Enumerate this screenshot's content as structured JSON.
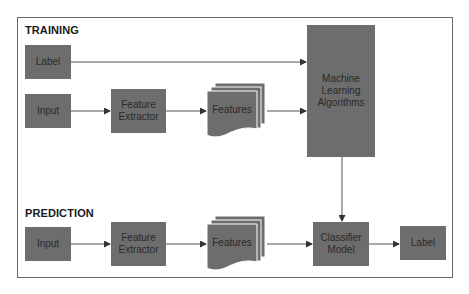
{
  "diagram": {
    "sections": {
      "training": {
        "title": "TRAINING"
      },
      "prediction": {
        "title": "PREDICTION"
      }
    },
    "training": {
      "label_node": "Label",
      "input_node": "Input",
      "feature_extractor": [
        "Feature",
        "Extractor"
      ],
      "features": "Features",
      "ml_algorithms": [
        "Machine",
        "Learning",
        "Algorithms"
      ]
    },
    "prediction": {
      "input_node": "Input",
      "feature_extractor": [
        "Feature",
        "Extractor"
      ],
      "features": "Features",
      "classifier": [
        "Classifier",
        "Model"
      ],
      "label_node": "Label"
    },
    "edges": [
      {
        "from": "training.label_node",
        "to": "training.ml_algorithms"
      },
      {
        "from": "training.input_node",
        "to": "training.feature_extractor"
      },
      {
        "from": "training.feature_extractor",
        "to": "training.features"
      },
      {
        "from": "training.features",
        "to": "training.ml_algorithms"
      },
      {
        "from": "training.ml_algorithms",
        "to": "prediction.classifier"
      },
      {
        "from": "prediction.input_node",
        "to": "prediction.feature_extractor"
      },
      {
        "from": "prediction.feature_extractor",
        "to": "prediction.features"
      },
      {
        "from": "prediction.features",
        "to": "prediction.classifier"
      },
      {
        "from": "prediction.classifier",
        "to": "prediction.label_node"
      }
    ],
    "colors": {
      "node_fill": "#6d6d6d",
      "node_text": "#2a2a2a",
      "edge": "#555555",
      "frame": "#6a6a6a"
    }
  }
}
